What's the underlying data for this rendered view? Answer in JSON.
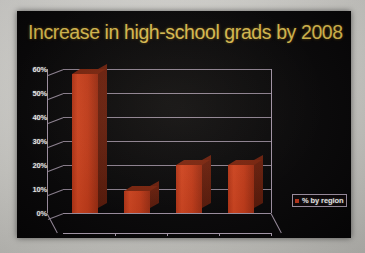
{
  "slide": {
    "title": "Increase in high-school grads by 2008",
    "background_color": "#050405",
    "title_color": "#e4c552"
  },
  "legend": {
    "label": "% by region",
    "swatch_color": "#c3361a",
    "position": "right"
  },
  "chart_data": {
    "type": "bar",
    "title": "Increase in high-school grads by 2008",
    "subtitle": "",
    "categories": [
      "West",
      "Midwest",
      "Northeast",
      "South"
    ],
    "values": [
      58,
      9,
      20,
      20
    ],
    "series": [
      {
        "name": "% by region",
        "values": [
          58,
          9,
          20,
          20
        ],
        "color": "#c3361a"
      }
    ],
    "xlabel": "",
    "ylabel": "",
    "ylim": [
      0,
      60
    ],
    "yticks": [
      0,
      10,
      20,
      30,
      40,
      50,
      60
    ],
    "ytick_labels": [
      "0%",
      "10%",
      "20%",
      "30%",
      "40%",
      "50%",
      "60%"
    ],
    "grid": true,
    "grid_color": "#a99aad",
    "legend_position": "right",
    "style": "3d-column",
    "axis_label_color": "#ffffff"
  }
}
